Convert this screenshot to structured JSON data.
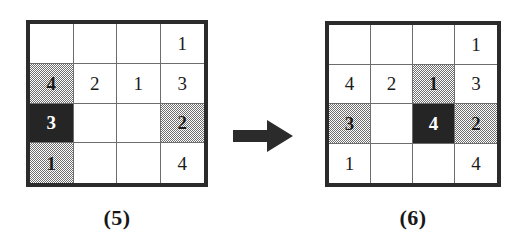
{
  "figure": {
    "kind": "grid-transformation-diagram",
    "arrow": {
      "name": "right-arrow",
      "direction": "right",
      "color": "#2b2b2b"
    },
    "colors": {
      "border": "#2b2b2b",
      "gridline": "#6d6d6d",
      "shaded": "#9e9e9e",
      "filled": "#252525",
      "text": "#1a1a1a",
      "text_on_filled": "#ffffff",
      "background": "#ffffff"
    },
    "panels": [
      {
        "id": "panel-5",
        "caption": "(5)",
        "rows": 4,
        "cols": 4,
        "cells": [
          [
            {
              "value": "",
              "style": "plain"
            },
            {
              "value": "",
              "style": "plain"
            },
            {
              "value": "",
              "style": "plain"
            },
            {
              "value": "1",
              "style": "plain"
            }
          ],
          [
            {
              "value": "4",
              "style": "shaded"
            },
            {
              "value": "2",
              "style": "plain"
            },
            {
              "value": "1",
              "style": "plain"
            },
            {
              "value": "3",
              "style": "plain"
            }
          ],
          [
            {
              "value": "3",
              "style": "filled"
            },
            {
              "value": "",
              "style": "plain"
            },
            {
              "value": "",
              "style": "plain"
            },
            {
              "value": "2",
              "style": "shaded"
            }
          ],
          [
            {
              "value": "1",
              "style": "shaded"
            },
            {
              "value": "",
              "style": "plain"
            },
            {
              "value": "",
              "style": "plain"
            },
            {
              "value": "4",
              "style": "plain"
            }
          ]
        ]
      },
      {
        "id": "panel-6",
        "caption": "(6)",
        "rows": 4,
        "cols": 4,
        "cells": [
          [
            {
              "value": "",
              "style": "plain"
            },
            {
              "value": "",
              "style": "plain"
            },
            {
              "value": "",
              "style": "plain"
            },
            {
              "value": "1",
              "style": "plain"
            }
          ],
          [
            {
              "value": "4",
              "style": "plain"
            },
            {
              "value": "2",
              "style": "plain"
            },
            {
              "value": "1",
              "style": "shaded"
            },
            {
              "value": "3",
              "style": "plain"
            }
          ],
          [
            {
              "value": "3",
              "style": "shaded"
            },
            {
              "value": "",
              "style": "plain"
            },
            {
              "value": "4",
              "style": "filled"
            },
            {
              "value": "2",
              "style": "shaded"
            }
          ],
          [
            {
              "value": "1",
              "style": "plain"
            },
            {
              "value": "",
              "style": "plain"
            },
            {
              "value": "",
              "style": "plain"
            },
            {
              "value": "4",
              "style": "plain"
            }
          ]
        ]
      }
    ]
  }
}
